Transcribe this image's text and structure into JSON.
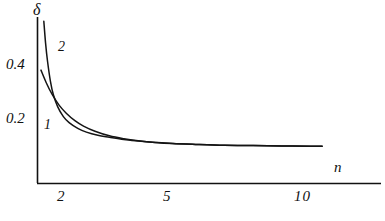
{
  "chart_data": {
    "type": "line",
    "title": "",
    "subtitle": "",
    "xlabel": "n",
    "ylabel": "δ",
    "xlim": [
      1.5,
      11.5
    ],
    "ylim": [
      0.0,
      0.58
    ],
    "xticks": [
      "2",
      "5",
      "10"
    ],
    "xtick_values": [
      2,
      5,
      10
    ],
    "yticks": [
      "0.2",
      "0.4"
    ],
    "ytick_values": [
      0.2,
      0.4
    ],
    "grid": false,
    "legend": "inline-curve-labels",
    "annotations": [
      {
        "text": "1",
        "x": 1.75,
        "y": 0.175,
        "note": "label for curve 1"
      },
      {
        "text": "2",
        "x": 2.35,
        "y": 0.47,
        "note": "label for curve 2"
      }
    ],
    "series": [
      {
        "name": "1",
        "label": "1",
        "color": "#141414",
        "x": [
          1.62,
          1.8,
          2.0,
          2.25,
          2.5,
          2.8,
          3.1,
          3.5,
          4.0,
          4.5,
          5.0,
          5.6,
          6.2,
          7.0,
          8.0,
          9.0,
          10.0,
          11.0,
          11.4
        ],
        "y": [
          0.395,
          0.352,
          0.312,
          0.273,
          0.245,
          0.219,
          0.2,
          0.182,
          0.166,
          0.156,
          0.149,
          0.143,
          0.139,
          0.136,
          0.133,
          0.132,
          0.131,
          0.13,
          0.13
        ]
      },
      {
        "name": "2",
        "label": "2",
        "color": "#141414",
        "x": [
          1.72,
          1.78,
          1.85,
          1.95,
          2.05,
          2.2,
          2.4,
          2.6,
          2.9,
          3.2,
          3.6,
          4.0,
          4.5,
          5.0,
          5.6,
          6.2,
          7.0,
          8.0,
          9.0,
          10.0,
          11.0,
          11.4
        ],
        "y": [
          0.565,
          0.49,
          0.425,
          0.356,
          0.31,
          0.268,
          0.233,
          0.212,
          0.192,
          0.179,
          0.168,
          0.161,
          0.153,
          0.148,
          0.143,
          0.139,
          0.136,
          0.133,
          0.132,
          0.131,
          0.13,
          0.13
        ]
      }
    ]
  },
  "axes": {
    "y_axis_title": "δ",
    "x_axis_title": "n",
    "ytick_0_2": "0.2",
    "ytick_0_4": "0.4",
    "xtick_2": "2",
    "xtick_5": "5",
    "xtick_10": "10",
    "curve_label_1": "1",
    "curve_label_2": "2",
    "axis_color": "#111111"
  }
}
